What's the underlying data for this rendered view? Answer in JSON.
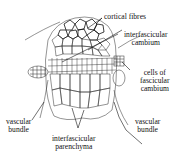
{
  "figure": {
    "labels": {
      "cortical_fibres": {
        "lines": [
          "cortical fibres"
        ]
      },
      "interfascicular_cambium": {
        "lines": [
          "interfascicular",
          "cambium"
        ]
      },
      "cells_of_fascicular_cambium": {
        "lines": [
          "cells of",
          "fascicular",
          "cambium"
        ]
      },
      "vascular_bundle_left": {
        "lines": [
          "vascular",
          "bundle"
        ]
      },
      "vascular_bundle_right": {
        "lines": [
          "vascular",
          "bundle"
        ]
      },
      "interfascicular_parenchyma": {
        "lines": [
          "interfascicular",
          "parenchyma"
        ]
      }
    },
    "colors": {
      "ink": "#1a1a1a",
      "background": "#ffffff"
    }
  }
}
